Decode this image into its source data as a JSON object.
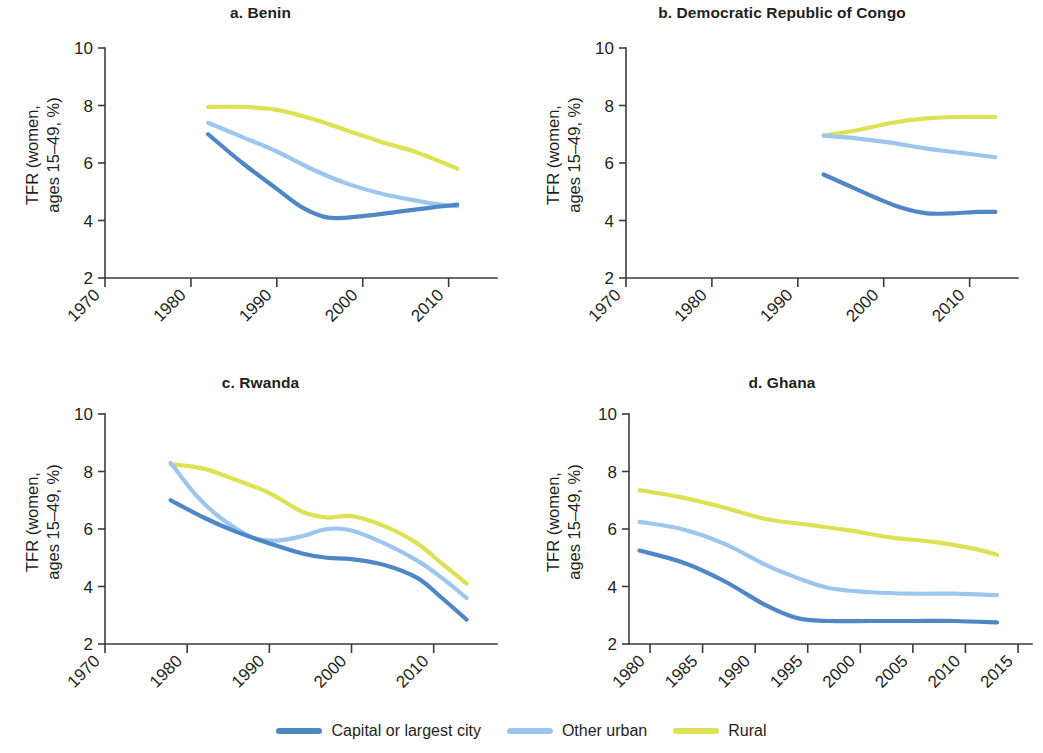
{
  "figure": {
    "background": "#ffffff",
    "axis_color": "#3b3b3b",
    "text_color": "#231f20"
  },
  "legend": {
    "position": "bottom-center",
    "items": [
      {
        "label": "Capital or largest city",
        "color": "#4e86c6",
        "swatch": "line-swatch"
      },
      {
        "label": "Other urban",
        "color": "#9cc6ee",
        "swatch": "line-swatch"
      },
      {
        "label": "Rural",
        "color": "#dde252",
        "swatch": "line-swatch"
      }
    ]
  },
  "axis": {
    "ylabel_line1": "TFR (women,",
    "ylabel_line2": "ages 15–49, %)",
    "yticks": [
      "10",
      "8",
      "6",
      "4",
      "2"
    ],
    "xticks_decade": [
      "1970",
      "1980",
      "1990",
      "2000",
      "2010"
    ],
    "xticks_five": [
      "1980",
      "1985",
      "1990",
      "1995",
      "2000",
      "2005",
      "2010",
      "2015"
    ]
  },
  "panels": [
    {
      "key": "a",
      "title": "a. Benin"
    },
    {
      "key": "b",
      "title": "b. Democratic Republic of Congo"
    },
    {
      "key": "c",
      "title": "c. Rwanda"
    },
    {
      "key": "d",
      "title": "d. Ghana"
    }
  ],
  "chart_data": [
    {
      "type": "line",
      "title": "a. Benin",
      "xlabel": "",
      "ylabel": "TFR (women, ages 15–49, %)",
      "xlim": [
        1970,
        2014
      ],
      "ylim": [
        2,
        10
      ],
      "xticks": [
        1970,
        1980,
        1990,
        2000,
        2010
      ],
      "yticks": [
        2,
        4,
        6,
        8,
        10
      ],
      "grid": false,
      "legend": "bottom",
      "series": [
        {
          "name": "Capital or largest city",
          "color": "#4e86c6",
          "x": [
            1982,
            1986,
            1990,
            1993,
            1996,
            2000,
            2004,
            2008,
            2011
          ],
          "values": [
            7.0,
            6.0,
            5.1,
            4.45,
            4.1,
            4.15,
            4.3,
            4.45,
            4.55
          ]
        },
        {
          "name": "Other urban",
          "color": "#9cc6ee",
          "x": [
            1982,
            1986,
            1990,
            1994,
            1998,
            2002,
            2006,
            2009,
            2011
          ],
          "values": [
            7.4,
            6.9,
            6.4,
            5.8,
            5.3,
            4.95,
            4.7,
            4.55,
            4.5
          ]
        },
        {
          "name": "Rural",
          "color": "#dde252",
          "x": [
            1982,
            1986,
            1990,
            1994,
            1998,
            2002,
            2006,
            2009,
            2011
          ],
          "values": [
            7.95,
            7.95,
            7.85,
            7.55,
            7.15,
            6.75,
            6.4,
            6.05,
            5.8
          ]
        }
      ]
    },
    {
      "type": "line",
      "title": "b. Democratic Republic of Congo",
      "xlabel": "",
      "ylabel": "TFR (women, ages 15–49, %)",
      "xlim": [
        1970,
        2014
      ],
      "ylim": [
        2,
        10
      ],
      "xticks": [
        1970,
        1980,
        1990,
        2000,
        2010
      ],
      "yticks": [
        2,
        4,
        6,
        8,
        10
      ],
      "grid": false,
      "legend": "bottom",
      "series": [
        {
          "name": "Capital or largest city",
          "color": "#4e86c6",
          "x": [
            1993,
            1996,
            1999,
            2002,
            2005,
            2008,
            2011,
            2013
          ],
          "values": [
            5.6,
            5.2,
            4.8,
            4.45,
            4.25,
            4.25,
            4.3,
            4.3
          ]
        },
        {
          "name": "Other urban",
          "color": "#9cc6ee",
          "x": [
            1993,
            1997,
            2001,
            2005,
            2009,
            2013
          ],
          "values": [
            6.95,
            6.85,
            6.7,
            6.5,
            6.35,
            6.2
          ]
        },
        {
          "name": "Rural",
          "color": "#dde252",
          "x": [
            1993,
            1997,
            2001,
            2005,
            2009,
            2013
          ],
          "values": [
            6.95,
            7.15,
            7.4,
            7.55,
            7.6,
            7.6
          ]
        }
      ]
    },
    {
      "type": "line",
      "title": "c. Rwanda",
      "xlabel": "",
      "ylabel": "TFR (women, ages 15–49, %)",
      "xlim": [
        1970,
        2016
      ],
      "ylim": [
        2,
        10
      ],
      "xticks": [
        1970,
        1980,
        1990,
        2000,
        2010
      ],
      "yticks": [
        2,
        4,
        6,
        8,
        10
      ],
      "grid": false,
      "legend": "bottom",
      "series": [
        {
          "name": "Capital or largest city",
          "color": "#4e86c6",
          "x": [
            1978,
            1982,
            1986,
            1990,
            1994,
            1997,
            2000,
            2004,
            2008,
            2011,
            2014
          ],
          "values": [
            7.0,
            6.4,
            5.9,
            5.5,
            5.15,
            5.0,
            4.95,
            4.75,
            4.3,
            3.6,
            2.85
          ]
        },
        {
          "name": "Other urban",
          "color": "#9cc6ee",
          "x": [
            1978,
            1981,
            1984,
            1988,
            1991,
            1994,
            1997,
            2000,
            2004,
            2008,
            2011,
            2014
          ],
          "values": [
            8.3,
            7.2,
            6.4,
            5.7,
            5.6,
            5.75,
            6.0,
            5.95,
            5.5,
            4.9,
            4.3,
            3.6
          ]
        },
        {
          "name": "Rural",
          "color": "#dde252",
          "x": [
            1978,
            1982,
            1986,
            1990,
            1994,
            1997,
            2000,
            2004,
            2008,
            2011,
            2014
          ],
          "values": [
            8.25,
            8.1,
            7.7,
            7.25,
            6.6,
            6.4,
            6.45,
            6.1,
            5.5,
            4.8,
            4.1
          ]
        }
      ]
    },
    {
      "type": "line",
      "title": "d. Ghana",
      "xlabel": "",
      "ylabel": "TFR (women, ages 15–49, %)",
      "xlim": [
        1978,
        2015
      ],
      "ylim": [
        2,
        10
      ],
      "xticks": [
        1980,
        1985,
        1990,
        1995,
        2000,
        2005,
        2010,
        2015
      ],
      "yticks": [
        2,
        4,
        6,
        8,
        10
      ],
      "grid": false,
      "legend": "bottom",
      "series": [
        {
          "name": "Capital or largest city",
          "color": "#4e86c6",
          "x": [
            1979,
            1983,
            1987,
            1991,
            1994,
            1997,
            2001,
            2005,
            2009,
            2013
          ],
          "values": [
            5.25,
            4.85,
            4.2,
            3.35,
            2.9,
            2.8,
            2.8,
            2.8,
            2.8,
            2.75
          ]
        },
        {
          "name": "Other urban",
          "color": "#9cc6ee",
          "x": [
            1979,
            1983,
            1987,
            1991,
            1994,
            1997,
            2001,
            2005,
            2009,
            2013
          ],
          "values": [
            6.25,
            6.0,
            5.5,
            4.75,
            4.3,
            3.95,
            3.8,
            3.75,
            3.75,
            3.7
          ]
        },
        {
          "name": "Rural",
          "color": "#dde252",
          "x": [
            1979,
            1983,
            1987,
            1991,
            1995,
            1999,
            2003,
            2007,
            2011,
            2013
          ],
          "values": [
            7.35,
            7.1,
            6.75,
            6.35,
            6.15,
            5.95,
            5.7,
            5.55,
            5.3,
            5.1
          ]
        }
      ]
    }
  ]
}
